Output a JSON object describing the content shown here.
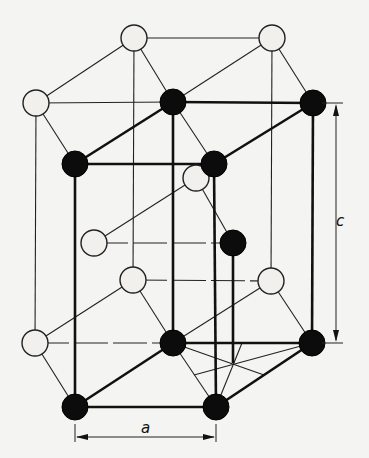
{
  "figure": {
    "labels": {
      "a": "a",
      "c": "c"
    },
    "atom_types": {
      "A": {
        "style": "dotted-white",
        "fill": "#f2f0ec"
      },
      "B": {
        "style": "solid-black",
        "fill": "#0c0c0c"
      }
    },
    "atoms": [
      {
        "id": "t1",
        "type": "A",
        "x": 134,
        "y": 38
      },
      {
        "id": "t2",
        "type": "A",
        "x": 272,
        "y": 38
      },
      {
        "id": "t3",
        "type": "A",
        "x": 36,
        "y": 103
      },
      {
        "id": "t4",
        "type": "B",
        "x": 173,
        "y": 102
      },
      {
        "id": "t5",
        "type": "B",
        "x": 313,
        "y": 103
      },
      {
        "id": "t6",
        "type": "B",
        "x": 75,
        "y": 164
      },
      {
        "id": "t7",
        "type": "B",
        "x": 214,
        "y": 164
      },
      {
        "id": "m1",
        "type": "A",
        "x": 196,
        "y": 178
      },
      {
        "id": "m2",
        "type": "A",
        "x": 94,
        "y": 243
      },
      {
        "id": "m3",
        "type": "B",
        "x": 233,
        "y": 243
      },
      {
        "id": "l1",
        "type": "A",
        "x": 133,
        "y": 280
      },
      {
        "id": "l2",
        "type": "A",
        "x": 271,
        "y": 281
      },
      {
        "id": "b1",
        "type": "A",
        "x": 35,
        "y": 343
      },
      {
        "id": "b2",
        "type": "B",
        "x": 173,
        "y": 343
      },
      {
        "id": "b3",
        "type": "B",
        "x": 312,
        "y": 343
      },
      {
        "id": "b4",
        "type": "B",
        "x": 75,
        "y": 407
      },
      {
        "id": "b5",
        "type": "B",
        "x": 216,
        "y": 407
      }
    ],
    "dimensions": {
      "a": {
        "from": [
          75,
          437
        ],
        "to": [
          216,
          437
        ],
        "label_pos": [
          147,
          434
        ]
      },
      "c": {
        "from": [
          336,
          103
        ],
        "to": [
          336,
          343
        ],
        "label_pos": [
          341,
          226
        ]
      }
    }
  }
}
